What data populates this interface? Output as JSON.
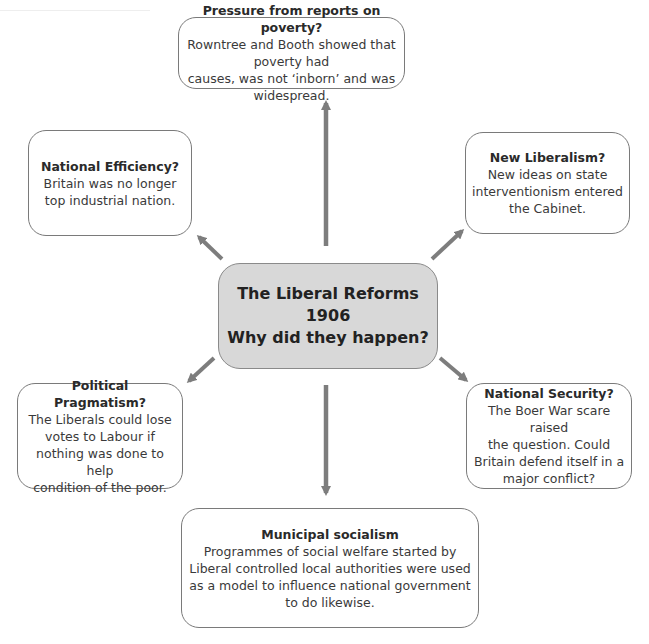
{
  "diagram": {
    "type": "spider-diagram",
    "center": {
      "lines": [
        "The Liberal Reforms",
        "1906",
        "Why did they happen?"
      ],
      "fill": "#d8d8d8"
    },
    "nodes": [
      {
        "id": "poverty-reports",
        "title": "Pressure from reports on poverty?",
        "lines": [
          "Rowntree and Booth showed that poverty had",
          "causes, was not ‘inborn’ and was widespread."
        ]
      },
      {
        "id": "national-efficiency",
        "title": "National Efficiency?",
        "lines": [
          "Britain was no longer",
          "top industrial nation."
        ]
      },
      {
        "id": "new-liberalism",
        "title": "New Liberalism?",
        "lines": [
          "New ideas on state",
          "interventionism entered",
          "the Cabinet."
        ]
      },
      {
        "id": "political-pragmatism",
        "title": "Political Pragmatism?",
        "lines": [
          "The Liberals could lose",
          "votes to Labour if",
          "nothing was done to help",
          "condition of the poor."
        ]
      },
      {
        "id": "national-security",
        "title": "National Security?",
        "lines": [
          "The Boer War scare raised",
          "the question. Could",
          "Britain defend itself in a",
          "major conflict?"
        ]
      },
      {
        "id": "municipal-socialism",
        "title": "Municipal socialism",
        "lines": [
          "Programmes of social welfare started by",
          "Liberal controlled local authorities were used",
          "as a model to influence national government",
          "to do likewise."
        ]
      }
    ],
    "edges": [
      {
        "from": "center",
        "to": "poverty-reports",
        "direction": "up"
      },
      {
        "from": "center",
        "to": "national-efficiency",
        "direction": "up-left"
      },
      {
        "from": "center",
        "to": "new-liberalism",
        "direction": "up-right"
      },
      {
        "from": "center",
        "to": "political-pragmatism",
        "direction": "down-left"
      },
      {
        "from": "center",
        "to": "national-security",
        "direction": "down-right"
      },
      {
        "from": "center",
        "to": "municipal-socialism",
        "direction": "down"
      }
    ],
    "colors": {
      "arrow": "#7d7d7d",
      "border": "#7a7a7a",
      "center_fill": "#d8d8d8",
      "text": "#2b2b2b"
    }
  }
}
